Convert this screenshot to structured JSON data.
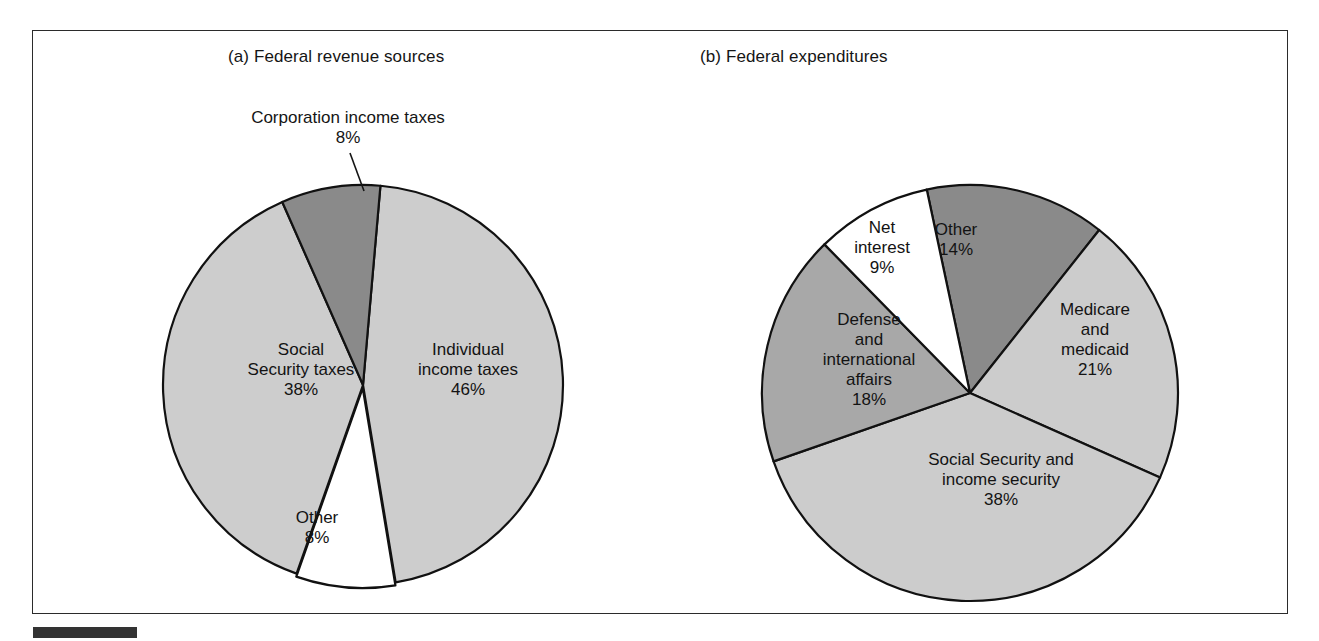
{
  "figure": {
    "background_color": "#ffffff",
    "frame_color": "#2b2b2b",
    "caption_bar_color": "#333333"
  },
  "panels": {
    "a": {
      "title": "(a) Federal revenue sources"
    },
    "b": {
      "title": "(b) Federal expenditures"
    }
  },
  "labels": {
    "corporation_callout": {
      "name": "Corporation income taxes",
      "value": "8%"
    },
    "individual_income_taxes": {
      "line1": "Individual",
      "line2": "income taxes",
      "value": "46%"
    },
    "social_security_taxes": {
      "line1": "Social",
      "line2": "Security taxes",
      "value": "38%"
    },
    "other_revenue": {
      "line1": "Other",
      "value": "8%"
    },
    "other_expenditure": {
      "line1": "Other",
      "value": "14%"
    },
    "net_interest": {
      "line1": "Net",
      "line2": "interest",
      "value": "9%"
    },
    "medicare_medicaid": {
      "line1": "Medicare",
      "line2": "and",
      "line3": "medicaid",
      "value": "21%"
    },
    "defense_international": {
      "line1": "Defense",
      "line2": "and",
      "line3": "international",
      "line4": "affairs",
      "value": "18%"
    },
    "social_security_income": {
      "line1": "Social Security and",
      "line2": "income security",
      "value": "38%"
    }
  },
  "chart_data": [
    {
      "type": "pie",
      "title": "(a) Federal revenue sources",
      "unit": "percent",
      "total": 100,
      "legend": "none",
      "labels_inside_slices": true,
      "categories": [
        "Individual income taxes",
        "Other",
        "Social Security taxes",
        "Corporation income taxes"
      ],
      "values": [
        46,
        8,
        38,
        8
      ],
      "slice_colors": [
        "#cdcdcd",
        "#ffffff",
        "#cdcdcd",
        "#8a8a8a"
      ],
      "slices": [
        {
          "label": "Individual income taxes",
          "value": 46,
          "value_text": "46%",
          "color": "#cdcdcd",
          "start_angle_deg": 5,
          "end_angle_deg": 170.6
        },
        {
          "label": "Other",
          "value": 8,
          "value_text": "8%",
          "color": "#ffffff",
          "start_angle_deg": 170.6,
          "end_angle_deg": 199.4
        },
        {
          "label": "Social Security taxes",
          "value": 38,
          "value_text": "38%",
          "color": "#cdcdcd",
          "start_angle_deg": 199.4,
          "end_angle_deg": 336.2
        },
        {
          "label": "Corporation income taxes",
          "value": 8,
          "value_text": "8%",
          "color": "#8a8a8a",
          "start_angle_deg": 336.2,
          "end_angle_deg": 365,
          "callout": true
        }
      ]
    },
    {
      "type": "pie",
      "title": "(b) Federal expenditures",
      "unit": "percent",
      "total": 100,
      "legend": "none",
      "labels_inside_slices": true,
      "categories": [
        "Other",
        "Medicare and medicaid",
        "Social Security and income security",
        "Defense and international affairs",
        "Net interest"
      ],
      "values": [
        14,
        21,
        38,
        18,
        9
      ],
      "slice_colors": [
        "#8a8a8a",
        "#cccccc",
        "#cccccc",
        "#a8a8a8",
        "#ffffff"
      ],
      "slices": [
        {
          "label": "Other",
          "value": 14,
          "value_text": "14%",
          "color": "#8a8a8a",
          "start_angle_deg": 348,
          "end_angle_deg": 398.4
        },
        {
          "label": "Medicare and medicaid",
          "value": 21,
          "value_text": "21%",
          "color": "#cccccc",
          "start_angle_deg": 398.4,
          "end_angle_deg": 474
        },
        {
          "label": "Social Security and income security",
          "value": 38,
          "value_text": "38%",
          "color": "#cccccc",
          "start_angle_deg": 474,
          "end_angle_deg": 610.8
        },
        {
          "label": "Defense and international affairs",
          "value": 18,
          "value_text": "18%",
          "color": "#a8a8a8",
          "start_angle_deg": 610.8,
          "end_angle_deg": 675.6
        },
        {
          "label": "Net interest",
          "value": 9,
          "value_text": "9%",
          "color": "#ffffff",
          "start_angle_deg": 675.6,
          "end_angle_deg": 708
        }
      ]
    }
  ]
}
